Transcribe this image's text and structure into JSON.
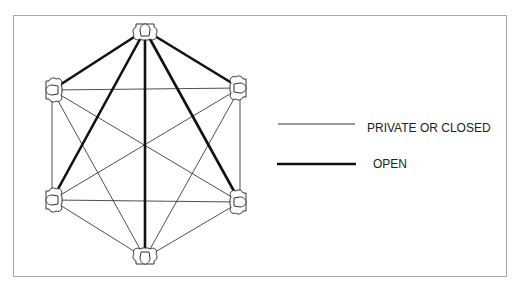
{
  "diagram": {
    "title": "",
    "nodes": [
      {
        "id": "top",
        "x": 145,
        "y": 30
      },
      {
        "id": "upper-left",
        "x": 52,
        "y": 90
      },
      {
        "id": "upper-right",
        "x": 240,
        "y": 88
      },
      {
        "id": "lower-left",
        "x": 52,
        "y": 200
      },
      {
        "id": "lower-right",
        "x": 240,
        "y": 202
      },
      {
        "id": "bottom",
        "x": 145,
        "y": 258
      }
    ],
    "edges_open": [
      [
        "top",
        "upper-left"
      ],
      [
        "top",
        "upper-right"
      ],
      [
        "top",
        "lower-left"
      ],
      [
        "top",
        "lower-right"
      ],
      [
        "top",
        "bottom"
      ]
    ],
    "edges_private": [
      [
        "upper-left",
        "upper-right"
      ],
      [
        "upper-left",
        "lower-left"
      ],
      [
        "upper-left",
        "lower-right"
      ],
      [
        "upper-left",
        "bottom"
      ],
      [
        "upper-right",
        "lower-left"
      ],
      [
        "upper-right",
        "lower-right"
      ],
      [
        "upper-right",
        "bottom"
      ],
      [
        "lower-left",
        "lower-right"
      ],
      [
        "lower-left",
        "bottom"
      ],
      [
        "lower-right",
        "bottom"
      ]
    ]
  },
  "legend": {
    "private": {
      "label": "PRIVATE OR CLOSED"
    },
    "open": {
      "label": "OPEN"
    }
  },
  "colors": {
    "line": "#111111",
    "frame": "#a8a8a8"
  }
}
